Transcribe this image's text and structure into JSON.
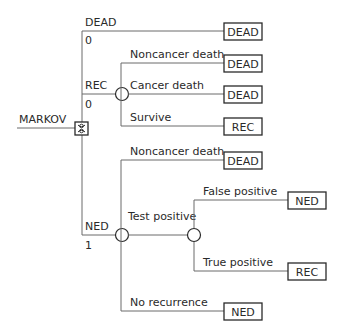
{
  "diagram": {
    "root": {
      "label": "MARKOV",
      "node_type": "markov"
    },
    "states": [
      {
        "name": "DEAD",
        "initial_prob": "0"
      },
      {
        "name": "REC",
        "initial_prob": "0"
      },
      {
        "name": "NED",
        "initial_prob": "1"
      }
    ],
    "dead_branch": {
      "terminal": "DEAD"
    },
    "rec_branch": {
      "node_type": "chance",
      "branches": [
        {
          "label": "Noncancer death",
          "terminal": "DEAD"
        },
        {
          "label": "Cancer death",
          "terminal": "DEAD"
        },
        {
          "label": "Survive",
          "terminal": "REC"
        }
      ]
    },
    "ned_branch": {
      "node_type": "chance",
      "branches": [
        {
          "label": "Noncancer death",
          "terminal": "DEAD"
        },
        {
          "label": "Test positive",
          "node_type": "chance",
          "branches": [
            {
              "label": "False positive",
              "terminal": "NED"
            },
            {
              "label": "True positive",
              "terminal": "REC"
            }
          ]
        },
        {
          "label": "No recurrence",
          "terminal": "NED"
        }
      ]
    }
  }
}
